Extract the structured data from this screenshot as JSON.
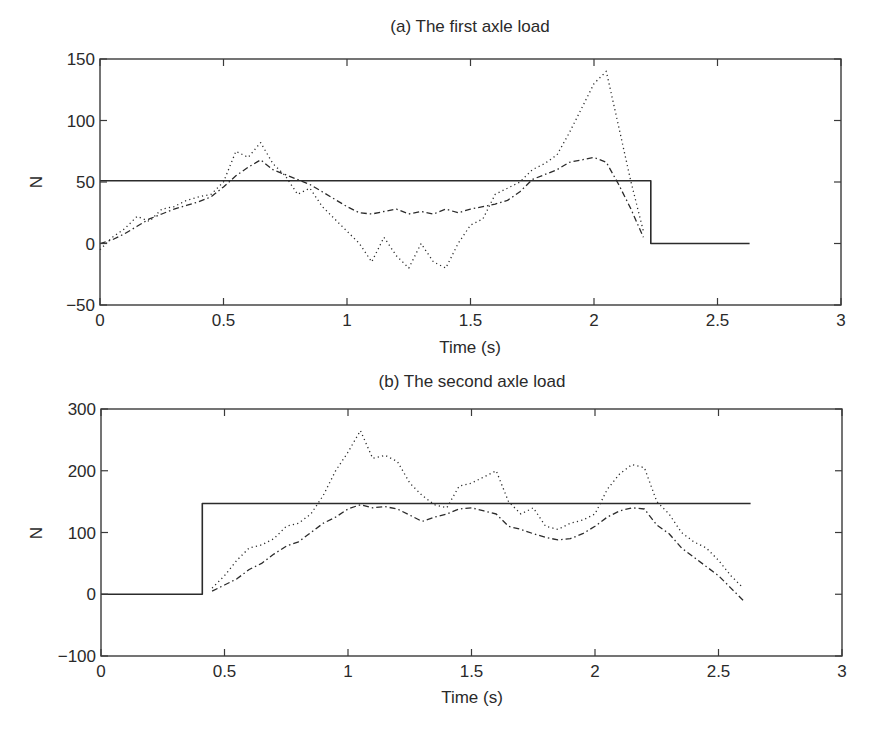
{
  "figure": {
    "width": 871,
    "height": 732,
    "colors": {
      "axis": "#3a3a3a",
      "line": "#2b2b2b",
      "background": "#ffffff"
    }
  },
  "chart_data": [
    {
      "type": "line",
      "title": "(a) The first axle load",
      "xlabel": "Time (s)",
      "ylabel": "N",
      "xlim": [
        0,
        3
      ],
      "ylim": [
        -50,
        150
      ],
      "xticks": [
        0,
        0.5,
        1,
        1.5,
        2,
        2.5,
        3
      ],
      "xtick_labels": [
        "0",
        "0.5",
        "1",
        "1.5",
        "2",
        "2.5",
        "3"
      ],
      "yticks": [
        -50,
        0,
        50,
        100,
        150
      ],
      "ytick_labels": [
        "−50",
        "0",
        "50",
        "100",
        "150"
      ],
      "grid": false,
      "legend": null,
      "box": {
        "left": 100,
        "top": 59,
        "right": 841,
        "bottom": 305
      },
      "series": [
        {
          "name": "static load",
          "style": "solid",
          "x": [
            0,
            2.23,
            2.23,
            2.63
          ],
          "y": [
            51,
            51,
            0,
            0
          ]
        },
        {
          "name": "identified load (dash-dot)",
          "style": "dashdot",
          "x": [
            0,
            0.05,
            0.1,
            0.15,
            0.2,
            0.25,
            0.3,
            0.35,
            0.4,
            0.45,
            0.5,
            0.55,
            0.6,
            0.65,
            0.7,
            0.75,
            0.8,
            0.85,
            0.9,
            0.95,
            1.0,
            1.05,
            1.1,
            1.15,
            1.2,
            1.25,
            1.3,
            1.35,
            1.4,
            1.45,
            1.5,
            1.55,
            1.6,
            1.65,
            1.7,
            1.75,
            1.8,
            1.85,
            1.9,
            1.95,
            2.0,
            2.05,
            2.1,
            2.15,
            2.2
          ],
          "y": [
            0,
            3,
            8,
            14,
            20,
            24,
            28,
            31,
            34,
            38,
            46,
            55,
            62,
            68,
            60,
            56,
            52,
            48,
            42,
            36,
            30,
            25,
            24,
            26,
            28,
            24,
            26,
            24,
            28,
            25,
            28,
            30,
            32,
            35,
            42,
            52,
            56,
            60,
            66,
            68,
            70,
            66,
            48,
            28,
            5
          ]
        },
        {
          "name": "identified load (dotted)",
          "style": "dotted",
          "x": [
            0,
            0.05,
            0.1,
            0.15,
            0.2,
            0.25,
            0.3,
            0.35,
            0.4,
            0.45,
            0.5,
            0.55,
            0.6,
            0.65,
            0.7,
            0.75,
            0.8,
            0.85,
            0.9,
            0.95,
            1.0,
            1.05,
            1.1,
            1.15,
            1.2,
            1.25,
            1.3,
            1.35,
            1.4,
            1.45,
            1.5,
            1.55,
            1.6,
            1.65,
            1.7,
            1.75,
            1.8,
            1.85,
            1.9,
            1.95,
            2.0,
            2.05,
            2.1,
            2.15,
            2.2
          ],
          "y": [
            -5,
            5,
            12,
            22,
            18,
            28,
            30,
            35,
            38,
            40,
            50,
            75,
            70,
            82,
            65,
            55,
            40,
            45,
            30,
            20,
            10,
            0,
            -15,
            5,
            -10,
            -20,
            0,
            -15,
            -20,
            0,
            15,
            20,
            40,
            45,
            50,
            60,
            65,
            72,
            90,
            110,
            130,
            140,
            95,
            50,
            10
          ]
        }
      ]
    },
    {
      "type": "line",
      "title": "(b) The second axle load",
      "xlabel": "Time (s)",
      "ylabel": "N",
      "xlim": [
        0,
        3
      ],
      "ylim": [
        -100,
        300
      ],
      "xticks": [
        0,
        0.5,
        1,
        1.5,
        2,
        2.5,
        3
      ],
      "xtick_labels": [
        "0",
        "0.5",
        "1",
        "1.5",
        "2",
        "2.5",
        "3"
      ],
      "yticks": [
        -100,
        0,
        100,
        200,
        300
      ],
      "ytick_labels": [
        "−100",
        "0",
        "100",
        "200",
        "300"
      ],
      "grid": false,
      "legend": null,
      "box": {
        "left": 101,
        "top": 409,
        "right": 842,
        "bottom": 656
      },
      "series": [
        {
          "name": "static load",
          "style": "solid",
          "x": [
            0,
            0.41,
            0.41,
            2.63
          ],
          "y": [
            0,
            0,
            147,
            147
          ]
        },
        {
          "name": "identified load (dash-dot)",
          "style": "dashdot",
          "x": [
            0.45,
            0.5,
            0.55,
            0.6,
            0.65,
            0.7,
            0.75,
            0.8,
            0.85,
            0.9,
            0.95,
            1.0,
            1.05,
            1.1,
            1.15,
            1.2,
            1.25,
            1.3,
            1.35,
            1.4,
            1.45,
            1.5,
            1.55,
            1.6,
            1.65,
            1.7,
            1.75,
            1.8,
            1.85,
            1.9,
            1.95,
            2.0,
            2.05,
            2.1,
            2.15,
            2.2,
            2.25,
            2.3,
            2.35,
            2.4,
            2.45,
            2.5,
            2.55,
            2.6
          ],
          "y": [
            5,
            15,
            25,
            40,
            50,
            65,
            78,
            85,
            100,
            115,
            125,
            138,
            145,
            140,
            142,
            138,
            128,
            118,
            125,
            130,
            138,
            140,
            135,
            130,
            110,
            105,
            98,
            92,
            88,
            90,
            98,
            110,
            125,
            135,
            140,
            138,
            112,
            98,
            75,
            60,
            45,
            30,
            10,
            -10
          ]
        },
        {
          "name": "identified load (dotted)",
          "style": "dotted",
          "x": [
            0.45,
            0.5,
            0.55,
            0.6,
            0.65,
            0.7,
            0.75,
            0.8,
            0.85,
            0.9,
            0.95,
            1.0,
            1.05,
            1.1,
            1.15,
            1.2,
            1.25,
            1.3,
            1.35,
            1.4,
            1.45,
            1.5,
            1.55,
            1.6,
            1.65,
            1.7,
            1.75,
            1.8,
            1.85,
            1.9,
            1.95,
            2.0,
            2.05,
            2.1,
            2.15,
            2.2,
            2.25,
            2.3,
            2.35,
            2.4,
            2.45,
            2.5,
            2.55,
            2.6
          ],
          "y": [
            10,
            30,
            55,
            75,
            80,
            90,
            110,
            115,
            130,
            160,
            200,
            230,
            265,
            220,
            225,
            215,
            180,
            160,
            145,
            140,
            175,
            180,
            190,
            200,
            150,
            130,
            140,
            110,
            105,
            115,
            120,
            130,
            170,
            195,
            210,
            205,
            150,
            130,
            100,
            85,
            75,
            55,
            30,
            10
          ]
        }
      ]
    }
  ]
}
